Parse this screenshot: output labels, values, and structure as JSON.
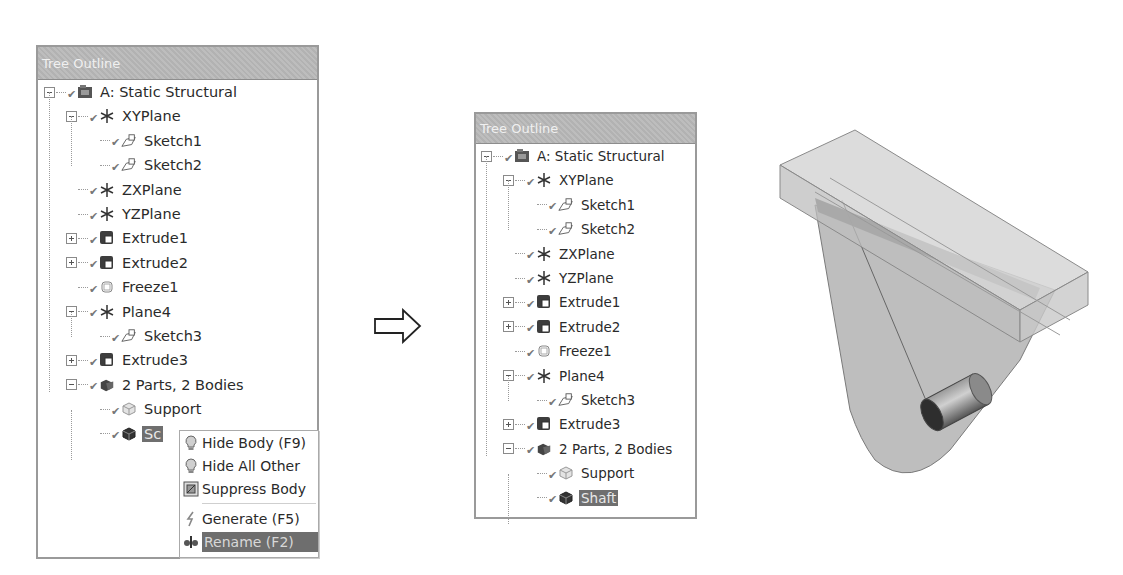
{
  "left_panel": {
    "title": "Tree Outline",
    "items": [
      {
        "label": "A: Static Structural",
        "icon": "static-structural-icon",
        "expander": "minus",
        "level": 0
      },
      {
        "label": "XYPlane",
        "icon": "plane-icon",
        "expander": "minus",
        "level": 1
      },
      {
        "label": "Sketch1",
        "icon": "sketch-icon",
        "expander": "none",
        "level": 2
      },
      {
        "label": "Sketch2",
        "icon": "sketch-icon",
        "expander": "none",
        "level": 2
      },
      {
        "label": "ZXPlane",
        "icon": "plane-icon",
        "expander": "none",
        "level": 1
      },
      {
        "label": "YZPlane",
        "icon": "plane-icon",
        "expander": "none",
        "level": 1
      },
      {
        "label": "Extrude1",
        "icon": "extrude-icon",
        "expander": "plus",
        "level": 1
      },
      {
        "label": "Extrude2",
        "icon": "extrude-icon",
        "expander": "plus",
        "level": 1
      },
      {
        "label": "Freeze1",
        "icon": "freeze-icon",
        "expander": "none",
        "level": 1
      },
      {
        "label": "Plane4",
        "icon": "plane-icon",
        "expander": "minus",
        "level": 1
      },
      {
        "label": "Sketch3",
        "icon": "sketch-icon",
        "expander": "none",
        "level": 2
      },
      {
        "label": "Extrude3",
        "icon": "extrude-icon",
        "expander": "plus",
        "level": 1
      },
      {
        "label": "2 Parts, 2 Bodies",
        "icon": "parts-bodies-icon",
        "expander": "minus",
        "level": 1
      },
      {
        "label": "Support",
        "icon": "body-icon-light",
        "expander": "none",
        "level": 2
      },
      {
        "label": "Sc",
        "icon": "body-icon-dark",
        "expander": "none",
        "level": 2,
        "selected": true
      }
    ]
  },
  "context_menu": {
    "items": [
      {
        "label": "Hide Body (F9)",
        "icon": "lightbulb-icon"
      },
      {
        "label": "Hide All Other",
        "icon": "lightbulb-icon"
      },
      {
        "label": "Suppress Body",
        "icon": "suppress-icon"
      },
      {
        "label": "Generate (F5)",
        "icon": "generate-icon"
      },
      {
        "label": "Rename (F2)",
        "icon": "rename-icon",
        "highlighted": true
      }
    ]
  },
  "arrow": {
    "icon": "right-arrow-icon"
  },
  "right_panel": {
    "title": "Tree Outline",
    "items": [
      {
        "label": "A: Static Structural",
        "icon": "static-structural-icon",
        "expander": "minus",
        "level": 0
      },
      {
        "label": "XYPlane",
        "icon": "plane-icon",
        "expander": "minus",
        "level": 1
      },
      {
        "label": "Sketch1",
        "icon": "sketch-icon",
        "expander": "none",
        "level": 2
      },
      {
        "label": "Sketch2",
        "icon": "sketch-icon",
        "expander": "none",
        "level": 2
      },
      {
        "label": "ZXPlane",
        "icon": "plane-icon",
        "expander": "none",
        "level": 1
      },
      {
        "label": "YZPlane",
        "icon": "plane-icon",
        "expander": "none",
        "level": 1
      },
      {
        "label": "Extrude1",
        "icon": "extrude-icon",
        "expander": "plus",
        "level": 1
      },
      {
        "label": "Extrude2",
        "icon": "extrude-icon",
        "expander": "plus",
        "level": 1
      },
      {
        "label": "Freeze1",
        "icon": "freeze-icon",
        "expander": "none",
        "level": 1
      },
      {
        "label": "Plane4",
        "icon": "plane-icon",
        "expander": "minus",
        "level": 1
      },
      {
        "label": "Sketch3",
        "icon": "sketch-icon",
        "expander": "none",
        "level": 2
      },
      {
        "label": "Extrude3",
        "icon": "extrude-icon",
        "expander": "plus",
        "level": 1
      },
      {
        "label": "2 Parts, 2 Bodies",
        "icon": "parts-bodies-icon",
        "expander": "minus",
        "level": 1
      },
      {
        "label": "Support",
        "icon": "body-icon-light",
        "expander": "none",
        "level": 2
      },
      {
        "label": "Shaft",
        "icon": "body-icon-dark",
        "expander": "none",
        "level": 2,
        "selected": true
      }
    ]
  },
  "model_view": {
    "description": "3D translucent support bracket with shaft"
  },
  "colors": {
    "header_bg": "#b9b9b9",
    "selection_bg": "#6f6f6f",
    "border": "#9a9a9a"
  }
}
